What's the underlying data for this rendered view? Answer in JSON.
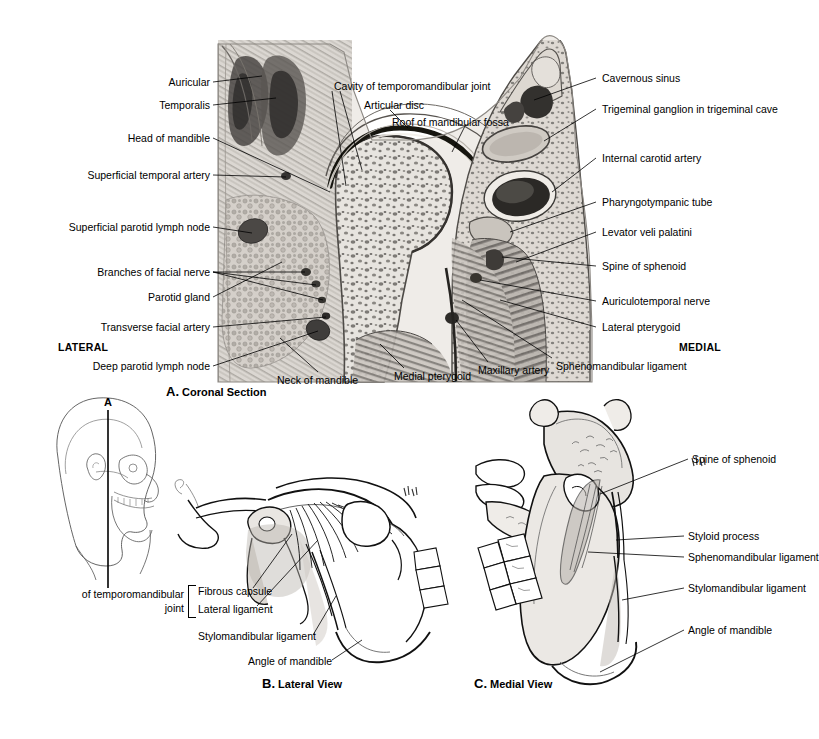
{
  "figure": {
    "panels": [
      {
        "id": "A",
        "letter": "A.",
        "caption": "Coronal Section",
        "type": "histological-coronal-section",
        "orientation_left": "LATERAL",
        "orientation_right": "MEDIAL",
        "labels_left": [
          "Auricular",
          "Temporalis",
          "Head of mandible",
          "Superficial temporal artery",
          "Superficial parotid lymph node",
          "Branches of facial nerve",
          "Parotid gland",
          "Transverse facial artery",
          "Deep parotid lymph node"
        ],
        "labels_top": [
          "Cavity of temporomandibular joint",
          "Articular disc",
          "Roof of mandibular fossa"
        ],
        "labels_right": [
          "Cavernous sinus",
          "Trigeminal ganglion in trigeminal cave",
          "Internal carotid artery",
          "Pharyngotympanic tube",
          "Levator veli palatini",
          "Spine of sphenoid",
          "Auriculotemporal nerve",
          "Lateral pterygoid"
        ],
        "labels_bottom": [
          "Neck of mandible",
          "Medial pterygoid",
          "Maxillary artery",
          "Sphenomandibular ligament"
        ]
      },
      {
        "id": "B",
        "letter": "B.",
        "caption": "Lateral View",
        "type": "line-drawing-lateral",
        "bracket_label_line1": "of temporomandibular",
        "bracket_label_line2": "joint",
        "bracket_items": [
          "Fibrous capsule",
          "Lateral ligament"
        ],
        "labels": [
          "Stylomandibular ligament",
          "Angle of mandible"
        ]
      },
      {
        "id": "C",
        "letter": "C.",
        "caption": "Medial View",
        "type": "line-drawing-medial",
        "labels": [
          "Spine of sphenoid",
          "Styloid process",
          "Sphenomandibular ligament",
          "Stylomandibular ligament",
          "Angle of mandible"
        ]
      }
    ],
    "orientation_key": {
      "plane_label": "A",
      "description": "lateral head outline with coronal section plane"
    }
  }
}
